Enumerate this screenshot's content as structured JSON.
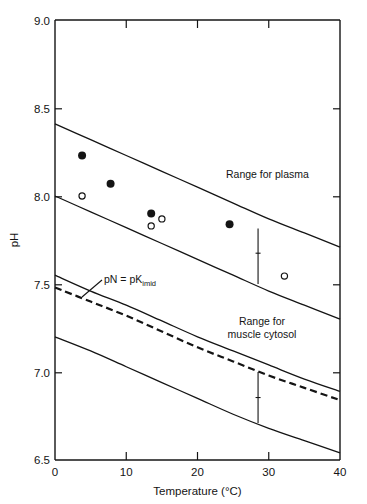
{
  "chart_data": {
    "type": "line",
    "title": "",
    "xlabel": "Temperature (°C)",
    "ylabel": "pH",
    "xlim": [
      0,
      40
    ],
    "ylim": [
      6.5,
      9.0
    ],
    "xticks": [
      0,
      10,
      20,
      30,
      40
    ],
    "xtick_labels": [
      "0",
      "10",
      "20",
      "30",
      "40"
    ],
    "yticks": [
      6.5,
      7.0,
      7.5,
      8.0,
      8.5,
      9.0
    ],
    "ytick_labels": [
      "6.5",
      "7.0",
      "7.5",
      "8.0",
      "8.5",
      "9.0"
    ],
    "grid": false,
    "legend": "none",
    "annotations": [
      {
        "name": "range-for-plasma",
        "text": "Range for plasma",
        "x": 24.0,
        "y": 8.07
      },
      {
        "name": "range-for-muscle-cytosol-line1",
        "text": "Range for",
        "x": 27.5,
        "y": 7.25
      },
      {
        "name": "range-for-muscle-cytosol-line2",
        "text": "muscle cytosol",
        "x": 27.5,
        "y": 7.19
      },
      {
        "name": "pn-equals-pk-imid",
        "text": "pN = pK",
        "subscript": "imid",
        "x": 7.5,
        "y": 7.52
      }
    ],
    "series": [
      {
        "name": "plasma-range-upper",
        "style": "solid",
        "x": [
          0,
          5,
          10,
          15,
          20,
          25,
          30,
          35,
          40
        ],
        "y": [
          8.41,
          8.32,
          8.23,
          8.14,
          8.05,
          7.96,
          7.87,
          7.79,
          7.71
        ]
      },
      {
        "name": "plasma-range-lower",
        "style": "solid",
        "x": [
          0,
          5,
          10,
          15,
          20,
          25,
          30,
          35,
          40
        ],
        "y": [
          8.0,
          7.91,
          7.82,
          7.73,
          7.64,
          7.55,
          7.46,
          7.38,
          7.3
        ]
      },
      {
        "name": "muscle-cytosol-range-upper",
        "style": "solid",
        "x": [
          0,
          5,
          10,
          15,
          20,
          25,
          30,
          35,
          40
        ],
        "y": [
          7.55,
          7.46,
          7.38,
          7.29,
          7.2,
          7.12,
          7.04,
          6.96,
          6.89
        ]
      },
      {
        "name": "pn-pk-imid-curve",
        "style": "dashed",
        "x": [
          0,
          5,
          10,
          15,
          20,
          25,
          30,
          35,
          40
        ],
        "y": [
          7.48,
          7.4,
          7.32,
          7.23,
          7.14,
          7.06,
          6.98,
          6.91,
          6.84
        ]
      },
      {
        "name": "muscle-cytosol-range-lower",
        "style": "solid",
        "x": [
          0,
          5,
          10,
          15,
          20,
          25,
          30,
          35,
          40
        ],
        "y": [
          7.2,
          7.12,
          7.03,
          6.94,
          6.85,
          6.76,
          6.68,
          6.61,
          6.54
        ]
      }
    ],
    "scatter": [
      {
        "name": "filled-circle",
        "marker": "filled-circle",
        "x": 3.8,
        "y": 8.23
      },
      {
        "name": "filled-circle",
        "marker": "filled-circle",
        "x": 7.8,
        "y": 8.07
      },
      {
        "name": "filled-circle",
        "marker": "filled-circle",
        "x": 13.5,
        "y": 7.9
      },
      {
        "name": "filled-circle",
        "marker": "filled-circle",
        "x": 24.5,
        "y": 7.84
      },
      {
        "name": "open-circle",
        "marker": "open-circle",
        "x": 3.8,
        "y": 8.0
      },
      {
        "name": "open-circle",
        "marker": "open-circle",
        "x": 13.5,
        "y": 7.83
      },
      {
        "name": "open-circle",
        "marker": "open-circle",
        "x": 15.0,
        "y": 7.87
      },
      {
        "name": "open-circle",
        "marker": "open-circle",
        "x": 32.2,
        "y": 7.545
      }
    ],
    "error_bars": [
      {
        "name": "error-bar-plasma",
        "x": 28.5,
        "y_low": 7.5,
        "y_high": 7.815,
        "y_center": 7.675
      },
      {
        "name": "error-bar-muscle-cytosol",
        "x": 28.5,
        "y_low": 6.71,
        "y_high": 7.0,
        "y_center": 6.855
      }
    ]
  }
}
